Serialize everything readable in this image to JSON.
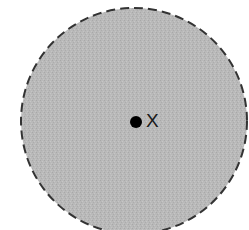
{
  "diagram": {
    "shape": "circle",
    "fill_color": "#b8b8b8",
    "border_style": "dashed",
    "border_color": "#333333",
    "point": {
      "label": "X",
      "color": "#000000"
    }
  }
}
